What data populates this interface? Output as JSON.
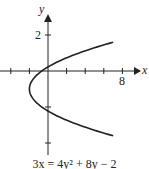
{
  "chart_data": {
    "type": "line",
    "title": "",
    "equation": "3x = 4y² + 8y − 2",
    "caption": "3x = 4y² + 8y − 2",
    "xlabel": "x",
    "ylabel": "y",
    "x_tick_labels": [
      {
        "value": 8,
        "label": "8"
      }
    ],
    "y_tick_labels": [
      {
        "value": 2,
        "label": "2"
      }
    ],
    "x_ticks": [
      -4,
      -2,
      2,
      4,
      6,
      8
    ],
    "y_ticks": [
      -6,
      -4,
      -2,
      2
    ],
    "xlim": [
      -5,
      10
    ],
    "ylim": [
      -7,
      3.5
    ],
    "grid": false,
    "legend": null,
    "vertex": {
      "x": -2,
      "y": -1
    },
    "series": [
      {
        "name": "parabola",
        "x": [
          9.3,
          6.3,
          4.0,
          2.0,
          0.3,
          -0.7,
          -1.3,
          -1.7,
          -2.0,
          -1.7,
          -1.3,
          -0.7,
          0.3,
          2.0,
          4.0,
          6.3,
          9.3
        ],
        "y": [
          1.6,
          1.0,
          0.5,
          0.0,
          -0.35,
          -0.6,
          -0.75,
          -0.87,
          -1.0,
          -1.13,
          -1.25,
          -1.4,
          -1.65,
          -2.0,
          -2.5,
          -3.0,
          -3.6
        ]
      }
    ]
  },
  "labels": {
    "x_axis": "x",
    "y_axis": "y",
    "x_tick_8": "8",
    "y_tick_2": "2",
    "caption": "3x = 4y² + 8y − 2"
  }
}
